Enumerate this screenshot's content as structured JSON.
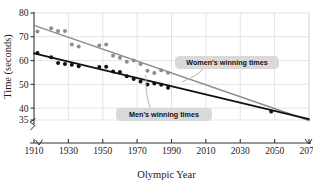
{
  "chart_data": {
    "type": "scatter",
    "title": "",
    "xlabel": "Olympic Year",
    "ylabel": "Time (seconds)",
    "xlim": [
      1910,
      2070
    ],
    "ylim": [
      35,
      80
    ],
    "xticks": [
      1910,
      1930,
      1950,
      1970,
      1990,
      2010,
      2030,
      2050,
      2070
    ],
    "yticks": [
      35,
      40,
      50,
      60,
      70,
      80
    ],
    "ytick_labels": [
      "35",
      "40",
      "50",
      "60",
      "70",
      "80"
    ],
    "xtick_labels": [
      "1910",
      "1930",
      "1950",
      "1970",
      "1990",
      "2010",
      "2030",
      "2050",
      "2070"
    ],
    "grid": true,
    "axis_break": true,
    "legend_position": "inline-callouts",
    "colors": {
      "women": "#8c8c8c",
      "men": "#111111",
      "grid": "#d8d8d8",
      "axis": "#333333",
      "callout_bg": "#d9d9d9",
      "background": "#ffffff"
    },
    "series": [
      {
        "name": "Women's winning times",
        "color": "#8c8c8c",
        "marker": "circle",
        "points": [
          [
            1912,
            72.2
          ],
          [
            1920,
            73.6
          ],
          [
            1924,
            72.4
          ],
          [
            1928,
            72.4
          ],
          [
            1932,
            66.8
          ],
          [
            1936,
            65.9
          ],
          [
            1948,
            66.3
          ],
          [
            1952,
            66.8
          ],
          [
            1956,
            62.0
          ],
          [
            1960,
            61.2
          ],
          [
            1964,
            59.5
          ],
          [
            1968,
            60.0
          ],
          [
            1972,
            58.6
          ],
          [
            1976,
            55.7
          ],
          [
            1980,
            54.8
          ],
          [
            1984,
            55.9
          ],
          [
            1988,
            54.9
          ]
        ],
        "trend_line": {
          "x1": 1910,
          "y1": 74.8,
          "x2": 2070,
          "y2": 34.8
        }
      },
      {
        "name": "Men's winning times",
        "color": "#111111",
        "marker": "circle",
        "points": [
          [
            1912,
            63.2
          ],
          [
            1920,
            61.4
          ],
          [
            1924,
            59.0
          ],
          [
            1928,
            58.6
          ],
          [
            1932,
            58.2
          ],
          [
            1936,
            57.6
          ],
          [
            1948,
            57.3
          ],
          [
            1952,
            57.4
          ],
          [
            1956,
            55.4
          ],
          [
            1960,
            55.2
          ],
          [
            1964,
            53.4
          ],
          [
            1968,
            52.2
          ],
          [
            1972,
            51.2
          ],
          [
            1976,
            49.9
          ],
          [
            1980,
            50.4
          ],
          [
            1984,
            49.8
          ],
          [
            1988,
            48.6
          ]
        ],
        "trend_line": {
          "x1": 1910,
          "y1": 63.0,
          "x2": 2070,
          "y2": 35.4
        }
      }
    ],
    "annotations": [
      {
        "id": "women-callout",
        "label": "Women's winning times",
        "target_x": 1996,
        "target_y": 51.0
      },
      {
        "id": "men-callout",
        "label": "Men's winning times",
        "target_x": 1975,
        "target_y": 54.0
      }
    ],
    "intersection_point": {
      "x": 2048,
      "y": 38.5,
      "marked": true
    }
  }
}
